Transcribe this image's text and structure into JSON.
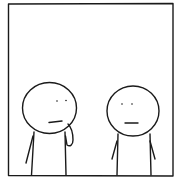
{
  "comic": {
    "panel_count": 1,
    "characters": [
      {
        "name": "left-stick-figure",
        "pose": "hand-on-chin, thinking"
      },
      {
        "name": "right-stick-figure",
        "pose": "neutral, arms down"
      }
    ],
    "colors": {
      "ink": "#1a1a1a",
      "background": "#ffffff"
    }
  }
}
